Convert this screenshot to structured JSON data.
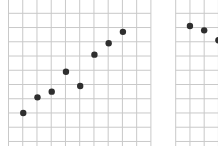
{
  "chart_data": [
    {
      "type": "scatter",
      "title": "",
      "xlabel": "",
      "ylabel": "",
      "grid": true,
      "legend": null,
      "panel": "left",
      "grid_cells": {
        "cols": 10,
        "rows": 10
      },
      "points": [
        {
          "x": 1,
          "y": 2
        },
        {
          "x": 2,
          "y": 3.1
        },
        {
          "x": 3,
          "y": 3.5
        },
        {
          "x": 4,
          "y": 4.9
        },
        {
          "x": 5,
          "y": 3.9
        },
        {
          "x": 6,
          "y": 6.1
        },
        {
          "x": 7,
          "y": 6.9
        },
        {
          "x": 8,
          "y": 7.7
        }
      ]
    },
    {
      "type": "scatter",
      "title": "",
      "xlabel": "",
      "ylabel": "",
      "grid": true,
      "legend": null,
      "panel": "right (partially cropped)",
      "points": [
        {
          "x": 1,
          "y": 8.1
        },
        {
          "x": 2,
          "y": 7.8
        },
        {
          "x": 3,
          "y": 7.1
        }
      ]
    }
  ],
  "colors": {
    "grid": "#c9c9c9",
    "point": "#2e2e2e",
    "background": "#ffffff"
  }
}
